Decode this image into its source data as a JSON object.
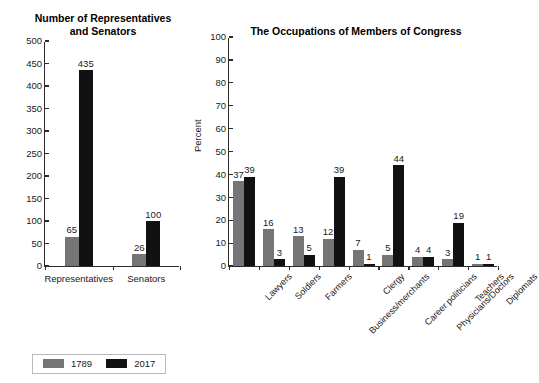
{
  "legend": {
    "entries": [
      {
        "label": "1789",
        "color": "#757575"
      },
      {
        "label": "2017",
        "color": "#111111"
      }
    ]
  },
  "chart_data": [
    {
      "id": "representatives-senators",
      "type": "bar",
      "title": "Number of Representatives\nand Senators",
      "xlabel": "",
      "ylabel": "",
      "ylim": [
        0,
        500
      ],
      "yticks": [
        0,
        50,
        100,
        150,
        200,
        250,
        300,
        350,
        400,
        450,
        500
      ],
      "grid": false,
      "legend_position": "bottom",
      "categories": [
        "Representatives",
        "Senators"
      ],
      "series": [
        {
          "name": "1789",
          "color": "#757575",
          "values": [
            65,
            26
          ]
        },
        {
          "name": "2017",
          "color": "#111111",
          "values": [
            435,
            100
          ]
        }
      ]
    },
    {
      "id": "occupations-members-congress",
      "type": "bar",
      "title": "The Occupations of Members of Congress",
      "xlabel": "",
      "ylabel": "Percent",
      "ylim": [
        0,
        100
      ],
      "yticks": [
        0,
        10,
        20,
        30,
        40,
        50,
        60,
        70,
        80,
        90,
        100
      ],
      "grid": false,
      "legend_position": "bottom",
      "categories": [
        "Lawyers",
        "Soldiers",
        "Farmers",
        "Business/merchants",
        "Clergy",
        "Career politicians",
        "Physicians/Doctors",
        "Teachers",
        "Diplomats"
      ],
      "series": [
        {
          "name": "1789",
          "color": "#757575",
          "values": [
            37,
            16,
            13,
            12,
            7,
            5,
            4,
            3,
            1
          ]
        },
        {
          "name": "2017",
          "color": "#111111",
          "values": [
            39,
            3,
            5,
            39,
            1,
            44,
            4,
            19,
            1
          ]
        }
      ]
    }
  ]
}
